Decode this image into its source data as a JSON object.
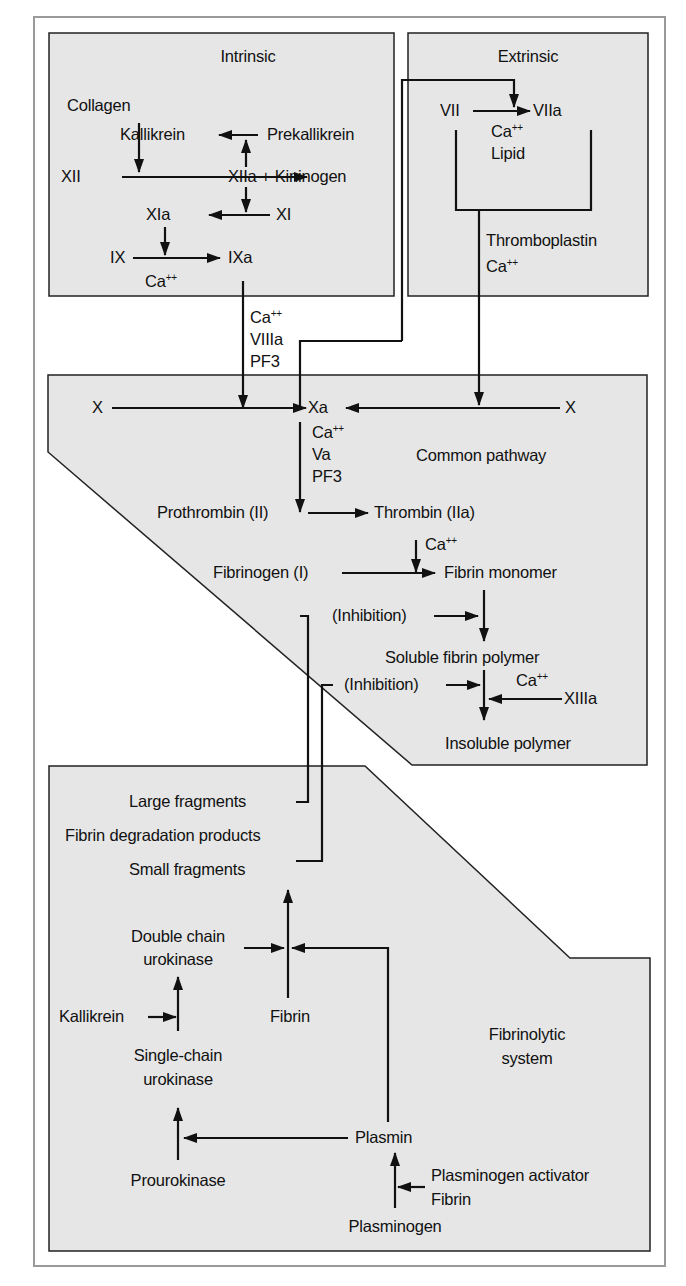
{
  "diagram": {
    "colors": {
      "panel_fill": "#e6e6e6",
      "frame_stroke": "#9a9a9a",
      "line": "#111111",
      "background": "#ffffff"
    },
    "sections": {
      "intrinsic": "Intrinsic",
      "extrinsic": "Extrinsic",
      "common": "Common pathway",
      "fibrinolytic_1": "Fibrinolytic",
      "fibrinolytic_2": "system"
    },
    "intrinsic": {
      "collagen": "Collagen",
      "kallikrein": "Kallikrein",
      "prekallikrein": "Prekallikrein",
      "xii": "XII",
      "xiia_kininogen": "XIIa + Kininogen",
      "xia": "XIa",
      "xi": "XI",
      "ix": "IX",
      "ixa": "IXa",
      "ca": "Ca",
      "ca_sup": "++"
    },
    "extrinsic": {
      "vii": "VII",
      "viia": "VIIa",
      "ca": "Ca",
      "ca_sup": "++",
      "lipid": "Lipid",
      "thromboplastin": "Thromboplastin",
      "ca2": "Ca",
      "ca2_sup": "++"
    },
    "intrinsic_to_x_cofactors": {
      "ca": "Ca",
      "ca_sup": "++",
      "viiia": "VIIIa",
      "pf3": "PF3"
    },
    "common": {
      "x_left": "X",
      "xa": "Xa",
      "x_right": "X",
      "ca": "Ca",
      "ca_sup": "++",
      "va": "Va",
      "pf3": "PF3",
      "prothrombin": "Prothrombin (II)",
      "thrombin": "Thrombin (IIa)",
      "ca2": "Ca",
      "ca2_sup": "++",
      "fibrinogen": "Fibrinogen (I)",
      "fibrin_monomer": "Fibrin monomer",
      "inhibition_1": "(Inhibition)",
      "soluble_polymer": "Soluble fibrin polymer",
      "inhibition_2": "(Inhibition)",
      "ca3": "Ca",
      "ca3_sup": "++",
      "xiiia": "XIIIa",
      "insoluble_polymer": "Insoluble polymer"
    },
    "fibrinolytic": {
      "large_fragments": "Large fragments",
      "fdp": "Fibrin degradation products",
      "small_fragments": "Small fragments",
      "double_chain_1": "Double chain",
      "double_chain_2": "urokinase",
      "kallikrein": "Kallikrein",
      "fibrin": "Fibrin",
      "single_chain_1": "Single-chain",
      "single_chain_2": "urokinase",
      "plasmin": "Plasmin",
      "prourokinase": "Prourokinase",
      "plasminogen_activator": "Plasminogen activator",
      "fibrin2": "Fibrin",
      "plasminogen": "Plasminogen"
    }
  }
}
